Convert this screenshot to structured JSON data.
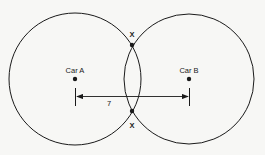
{
  "diagram": {
    "circles": [
      {
        "id": "circle-a",
        "cx": 75,
        "cy": 79,
        "r": 66
      },
      {
        "id": "circle-b",
        "cx": 189,
        "cy": 79,
        "r": 65
      }
    ],
    "points": [
      {
        "id": "car-a",
        "label": "Car A",
        "x": 75,
        "y": 79
      },
      {
        "id": "car-b",
        "label": "Car B",
        "x": 189,
        "y": 79
      }
    ],
    "intersections": [
      {
        "id": "top",
        "label": "X",
        "x": 132,
        "y": 45
      },
      {
        "id": "bottom",
        "label": "X",
        "x": 132,
        "y": 111
      }
    ],
    "distance": {
      "label": "7",
      "x1": 76,
      "x2": 189,
      "y": 96
    },
    "colors": {
      "stroke": "#1a1a1a",
      "background": "#f7f7f5"
    }
  }
}
